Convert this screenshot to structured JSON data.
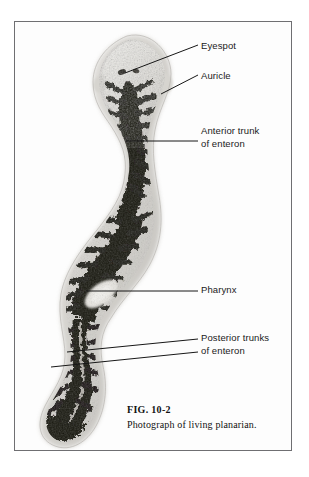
{
  "figure": {
    "number": "FIG. 10-2",
    "caption": "Photograph of living planarian.",
    "frame_color": "#6f6f72",
    "background_color": "#ffffff",
    "plate_background": "#fdfdfd"
  },
  "callouts": [
    {
      "id": "eyespot",
      "label": "Eyespot",
      "leader": {
        "x1": 110,
        "y1": 51,
        "x2": 183,
        "y2": 23
      }
    },
    {
      "id": "auricle",
      "label": "Auricle",
      "leader": {
        "x1": 146,
        "y1": 72,
        "x2": 183,
        "y2": 53
      }
    },
    {
      "id": "anterior-trunk",
      "label": "Anterior trunk\nof enteron",
      "leader": {
        "x1": 111,
        "y1": 119,
        "x2": 183,
        "y2": 119
      }
    },
    {
      "id": "pharynx",
      "label": "Pharynx",
      "leader": {
        "x1": 71,
        "y1": 269,
        "x2": 183,
        "y2": 269
      }
    },
    {
      "id": "posterior-trunks-upper",
      "label": "",
      "leader": {
        "x1": 52,
        "y1": 330,
        "x2": 183,
        "y2": 317
      }
    },
    {
      "id": "posterior-trunks-lower",
      "label": "Posterior trunks\nof enteron",
      "leader": {
        "x1": 36,
        "y1": 345,
        "x2": 183,
        "y2": 330
      }
    }
  ],
  "specimen": {
    "name": "living planarian",
    "body_color": "#1c1a18",
    "margin_color": "#c9c7c2",
    "head_color": "#dedcd7"
  }
}
